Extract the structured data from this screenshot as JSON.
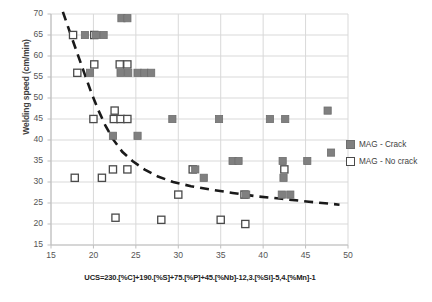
{
  "chart_data": {
    "type": "scatter",
    "title": "",
    "xlabel": "UCS=230.[%C]+190.[%S]+75.[%P]+45.[%Nb]-12,3.[%Si]-5,4.[%Mn]-1",
    "ylabel": "Welding speed (cm/min)",
    "xlim": [
      15,
      50
    ],
    "ylim": [
      15,
      70
    ],
    "xticks": [
      15,
      20,
      25,
      30,
      35,
      40,
      45,
      50
    ],
    "yticks": [
      15,
      20,
      25,
      30,
      35,
      40,
      45,
      50,
      55,
      60,
      65,
      70
    ],
    "grid": true,
    "legend_position": "right",
    "colors": {
      "crack_fill": "#808080",
      "crack_stroke": "#6e6e6e",
      "nocrack_fill": "#ffffff",
      "nocrack_stroke": "#4a4a4a",
      "trend": "#1a1a1a",
      "grid": "#d9d9d9",
      "axis": "#bfbfbf",
      "text": "#3f3f3f"
    },
    "series": [
      {
        "name": "MAG - Crack",
        "marker": "filled-square",
        "points": [
          [
            19.0,
            65.0
          ],
          [
            20.3,
            65.0
          ],
          [
            21.2,
            65.0
          ],
          [
            23.3,
            69.0
          ],
          [
            24.0,
            69.0
          ],
          [
            19.6,
            56.0
          ],
          [
            23.2,
            56.0
          ],
          [
            24.1,
            56.0
          ],
          [
            25.2,
            56.0
          ],
          [
            26.0,
            56.0
          ],
          [
            26.8,
            56.0
          ],
          [
            29.3,
            45.0
          ],
          [
            34.8,
            45.0
          ],
          [
            40.8,
            45.0
          ],
          [
            42.6,
            45.0
          ],
          [
            47.6,
            47.0
          ],
          [
            22.3,
            41.0
          ],
          [
            25.2,
            41.0
          ],
          [
            36.4,
            35.0
          ],
          [
            37.1,
            35.0
          ],
          [
            42.3,
            35.0
          ],
          [
            45.2,
            35.0
          ],
          [
            32.0,
            33.0
          ],
          [
            42.4,
            31.0
          ],
          [
            38.0,
            27.0
          ],
          [
            42.2,
            27.0
          ],
          [
            43.2,
            27.0
          ],
          [
            33.0,
            31.0
          ],
          [
            48.0,
            37.0
          ]
        ]
      },
      {
        "name": "MAG - No crack",
        "marker": "open-square",
        "points": [
          [
            17.6,
            65.0
          ],
          [
            20.1,
            65.0
          ],
          [
            18.1,
            56.0
          ],
          [
            20.1,
            58.0
          ],
          [
            23.1,
            58.0
          ],
          [
            24.0,
            58.0
          ],
          [
            20.0,
            45.0
          ],
          [
            22.5,
            47.0
          ],
          [
            22.4,
            45.0
          ],
          [
            23.2,
            45.0
          ],
          [
            24.0,
            45.0
          ],
          [
            17.8,
            31.0
          ],
          [
            21.0,
            31.0
          ],
          [
            22.3,
            33.0
          ],
          [
            24.0,
            33.0
          ],
          [
            31.7,
            33.0
          ],
          [
            42.5,
            33.0
          ],
          [
            30.0,
            27.0
          ],
          [
            37.8,
            27.0
          ],
          [
            22.6,
            21.5
          ],
          [
            28.0,
            21.0
          ],
          [
            35.0,
            21.0
          ],
          [
            37.9,
            20.0
          ]
        ]
      }
    ],
    "trendline": {
      "style": "dashed",
      "points": [
        [
          16.4,
          70.5
        ],
        [
          17.0,
          67.0
        ],
        [
          17.6,
          63.5
        ],
        [
          18.3,
          59.5
        ],
        [
          19.0,
          55.5
        ],
        [
          19.8,
          51.0
        ],
        [
          20.6,
          47.0
        ],
        [
          21.4,
          43.5
        ],
        [
          22.3,
          40.2
        ],
        [
          23.4,
          37.2
        ],
        [
          24.6,
          35.0
        ],
        [
          26.0,
          33.0
        ],
        [
          27.6,
          31.3
        ],
        [
          29.4,
          30.0
        ],
        [
          31.5,
          29.0
        ],
        [
          33.8,
          28.2
        ],
        [
          36.4,
          27.4
        ],
        [
          39.2,
          26.6
        ],
        [
          42.2,
          26.0
        ],
        [
          45.4,
          25.3
        ],
        [
          49.0,
          24.6
        ]
      ]
    }
  },
  "legend": {
    "items": [
      {
        "label": "MAG - Crack",
        "marker": "filled-square"
      },
      {
        "label": "MAG - No crack",
        "marker": "open-square"
      }
    ]
  }
}
